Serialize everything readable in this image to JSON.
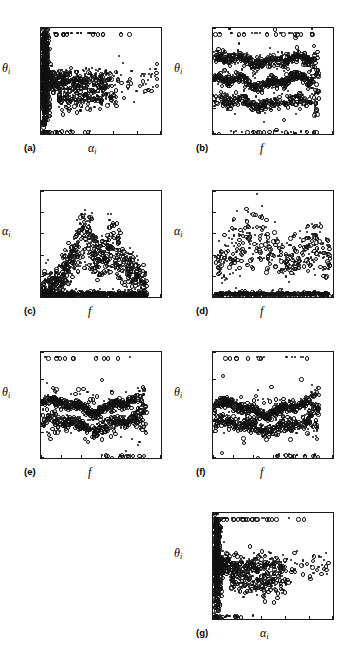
{
  "figure": {
    "panel_count": 7,
    "layout": "4 rows x 2 columns, last row has only right panel occupied"
  },
  "chart_data": [
    {
      "id": "a",
      "panel_label": "(a)",
      "type": "scatter",
      "title": "",
      "xlabel": "αi",
      "ylabel": "θi",
      "xlim": [
        1,
        3.5
      ],
      "ylim": [
        -100,
        100
      ],
      "xticks": [
        1,
        1.5,
        2,
        2.5,
        3,
        3.5
      ],
      "xticklabels": [
        "1",
        "1.5",
        "2",
        "2.5",
        "3",
        "3.5"
      ],
      "yticks": [
        -100,
        -50,
        0,
        50,
        100
      ],
      "yticklabels": [
        "-100",
        "-50",
        "0",
        "50",
        "100"
      ],
      "grid": false,
      "legend": "none",
      "marker": "open-circle",
      "description": "Dense vertical cluster at alpha near 1.05-1.2 spanning theta -100 to 90; horizontal spread of points near theta 0 and a lower lobe near theta -30 extending to alpha 3.5; isolated rows of points at theta = 90 and theta = -95.",
      "seed": 11,
      "n_points": 1400
    },
    {
      "id": "b",
      "panel_label": "(b)",
      "type": "scatter",
      "title": "",
      "xlabel": "f",
      "ylabel": "θi",
      "xlim": [
        0,
        300
      ],
      "ylim": [
        -100,
        100
      ],
      "xticks": [
        0,
        50,
        100,
        150,
        200,
        250,
        300
      ],
      "xticklabels": [
        "0",
        "50",
        "100",
        "150",
        "200",
        "250",
        "300"
      ],
      "yticks": [
        -100,
        -50,
        0,
        50,
        100
      ],
      "yticklabels": [
        "-100",
        "-50",
        "0",
        "50",
        "100"
      ],
      "grid": false,
      "legend": "none",
      "marker": "open-circle",
      "description": "Three wavy horizontal bands near theta = +40, 0 and -40 over f = 0 to 260; scattered outliers at theta = +90 and theta = -95.",
      "seed": 22,
      "n_points": 1250
    },
    {
      "id": "c",
      "panel_label": "(c)",
      "type": "scatter",
      "title": "",
      "xlabel": "f",
      "ylabel": "αi",
      "xlim": [
        0,
        300
      ],
      "ylim": [
        1,
        3.5
      ],
      "xticks": [
        0,
        50,
        100,
        150,
        200,
        250,
        300
      ],
      "xticklabels": [
        "0",
        "50",
        "100",
        "150",
        "200",
        "250",
        "300"
      ],
      "yticks": [
        1,
        1.5,
        2,
        2.5,
        3,
        3.5
      ],
      "yticklabels": [
        "1",
        "1.5",
        "2",
        "2.5",
        "3",
        "3.5"
      ],
      "grid": false,
      "legend": "none",
      "marker": "open-circle",
      "description": "Dense saturated baseline at alpha = 1.05-1.15 across f = 0 to 260, with an upward scatter cloud peaking near f = 110 and f = 175 reaching alpha 3.2-3.4.",
      "seed": 33,
      "n_points": 1200
    },
    {
      "id": "d",
      "panel_label": "(d)",
      "type": "scatter",
      "title": "",
      "xlabel": "f",
      "ylabel": "αi",
      "xlim": [
        60,
        200
      ],
      "ylim": [
        1,
        3.5
      ],
      "xticks": [
        60,
        80,
        100,
        120,
        140,
        160,
        180,
        200
      ],
      "xticklabels": [
        "60",
        "80",
        "100",
        "120",
        "140",
        "160",
        "180",
        "200"
      ],
      "yticks": [
        1,
        1.5,
        2,
        2.5,
        3,
        3.5
      ],
      "yticklabels": [
        "1",
        "1.5",
        "2",
        "2.5",
        "3",
        "3.5"
      ],
      "grid": false,
      "legend": "none",
      "marker": "open-circle",
      "description": "Zoomed view of panel (c) over f = 60 to 195: dense baseline at alpha 1.1 plus a wavy mid cloud around alpha 1.7-2.2 with peaks near f = 112 and f = 172 reaching alpha 3.2.",
      "seed": 44,
      "n_points": 620
    },
    {
      "id": "e",
      "panel_label": "(e)",
      "type": "scatter",
      "title": "",
      "xlabel": "f",
      "ylabel": "θi",
      "xlim": [
        0,
        300
      ],
      "ylim": [
        -100,
        100
      ],
      "xticks": [
        0,
        50,
        100,
        150,
        200,
        250,
        300
      ],
      "xticklabels": [
        "0",
        "50",
        "100",
        "150",
        "200",
        "250",
        "300"
      ],
      "yticks": [
        -100,
        -50,
        0,
        50,
        100
      ],
      "yticklabels": [
        "-100",
        "-50",
        "0",
        "50",
        "100"
      ],
      "grid": false,
      "legend": "none",
      "marker": "open-circle",
      "description": "Two wavy bands near theta = 0 and theta = -35 over f = 0 to 260; sparse outliers at theta = +90 and theta = -95 and a rising tail after f = 230.",
      "seed": 55,
      "n_points": 950
    },
    {
      "id": "f",
      "panel_label": "(f)",
      "type": "scatter",
      "title": "",
      "xlabel": "f",
      "ylabel": "θi",
      "xlim": [
        0,
        300
      ],
      "ylim": [
        -100,
        100
      ],
      "xticks": [
        0,
        50,
        100,
        150,
        200,
        250,
        300
      ],
      "xticklabels": [
        "0",
        "50",
        "100",
        "150",
        "200",
        "250",
        "300"
      ],
      "yticks": [
        -100,
        -50,
        0,
        50,
        100
      ],
      "yticklabels": [
        "-100",
        "-50",
        "0",
        "50",
        "100"
      ],
      "grid": false,
      "legend": "none",
      "marker": "open-circle",
      "description": "Similar to (e): two wavy bands near theta = -5 and theta = -38 over f = 0 to 260, outliers at theta = +90 and theta = -92, rising tail near f = 240.",
      "seed": 66,
      "n_points": 930
    },
    {
      "id": "g",
      "panel_label": "(g)",
      "type": "scatter",
      "title": "",
      "xlabel": "αi",
      "ylabel": "θi",
      "xlim": [
        1,
        3.5
      ],
      "ylim": [
        -100,
        100
      ],
      "xticks": [
        1,
        1.5,
        2,
        2.5,
        3,
        3.5
      ],
      "xticklabels": [
        "1",
        "1.5",
        "2",
        "2.5",
        "3",
        "3.5"
      ],
      "yticks": [
        -100,
        -50,
        0,
        50,
        100
      ],
      "yticklabels": [
        "-100",
        "-50",
        "0",
        "50",
        "100"
      ],
      "grid": false,
      "legend": "none",
      "marker": "open-circle",
      "description": "Dense vertical cluster at alpha near 1.05-1.2 spanning theta -95 to 85; a horizontal arm near theta 0 thinning out to alpha 3.1 and a lower lobe near theta -35; rows of markers at theta = 90 and theta = -92.",
      "seed": 77,
      "n_points": 1150
    }
  ]
}
